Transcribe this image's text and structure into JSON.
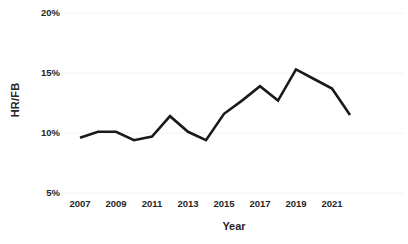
{
  "chart_data": {
    "type": "line",
    "title": "",
    "xlabel": "Year",
    "ylabel": "HR/FB",
    "x": [
      2007,
      2008,
      2009,
      2010,
      2011,
      2012,
      2013,
      2014,
      2015,
      2016,
      2017,
      2018,
      2019,
      2020,
      2021,
      2022
    ],
    "values": [
      9.6,
      10.1,
      10.1,
      9.4,
      9.7,
      11.4,
      10.1,
      9.4,
      11.6,
      12.7,
      13.9,
      12.7,
      15.3,
      14.5,
      13.7,
      11.5
    ],
    "series": [
      {
        "name": "HR/FB",
        "values": [
          9.6,
          10.1,
          10.1,
          9.4,
          9.7,
          11.4,
          10.1,
          9.4,
          11.6,
          12.7,
          13.9,
          12.7,
          15.3,
          14.5,
          13.7,
          11.5
        ]
      }
    ],
    "ylim": [
      5,
      20
    ],
    "xlim": [
      2007,
      2022
    ],
    "ytick_labels": [
      "20%",
      "15%",
      "10%",
      "5%"
    ],
    "ytick_values": [
      20,
      15,
      10,
      5
    ],
    "xtick_labels": [
      "2007",
      "2009",
      "2011",
      "2013",
      "2015",
      "2017",
      "2019",
      "2021"
    ],
    "xtick_values": [
      2007,
      2009,
      2011,
      2013,
      2015,
      2017,
      2019,
      2021
    ],
    "grid": "horizontal",
    "legend": "none",
    "line_color": "#1a1a1a",
    "grid_color": "#f2f2f2",
    "text_color": "#262626"
  }
}
